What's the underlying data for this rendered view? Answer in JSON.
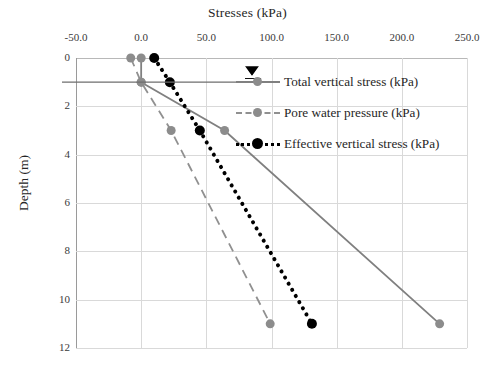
{
  "chart_data": {
    "type": "line",
    "title": "",
    "xlabel": "Stresses (kPa)",
    "ylabel": "Depth (m)",
    "xlim": [
      -50.0,
      250.0
    ],
    "ylim": [
      0,
      12
    ],
    "y_inverted": true,
    "grid": true,
    "legend_position": "inside-top-right",
    "xticks": [
      "-50.0",
      "0.0",
      "50.0",
      "100.0",
      "150.0",
      "200.0",
      "250.0"
    ],
    "xtick_values": [
      -50.0,
      0.0,
      50.0,
      100.0,
      150.0,
      200.0,
      250.0
    ],
    "yticks": [
      "0",
      "2",
      "4",
      "6",
      "8",
      "10",
      "12"
    ],
    "ytick_values": [
      0,
      2,
      4,
      6,
      8,
      10,
      12
    ],
    "series": [
      {
        "name": "Total vertical stress (kPa)",
        "color": "#808080",
        "style": "solid",
        "marker": "circle-gray",
        "x": [
          0,
          0,
          64,
          229
        ],
        "y": [
          0,
          1,
          3,
          11
        ]
      },
      {
        "name": "Pore water pressure (kPa)",
        "color": "#909090",
        "style": "dashed",
        "marker": "circle-gray",
        "x": [
          -8,
          0,
          23,
          99
        ],
        "y": [
          0,
          1,
          3,
          11
        ]
      },
      {
        "name": "Effective vertical stress (kPa)",
        "color": "#000000",
        "style": "dotted",
        "marker": "circle-black",
        "x": [
          10,
          22,
          45,
          131
        ],
        "y": [
          0,
          1,
          3,
          11
        ]
      }
    ],
    "annotations": [
      {
        "name": "water-table",
        "symbol": "triangle-down-with-lines",
        "depth": 1.0,
        "x_position": 85
      },
      {
        "name": "water-table-level-line",
        "symbol": "horizontal-line",
        "depth": 1.0
      }
    ]
  },
  "legend": {
    "items": [
      {
        "label": "Total vertical stress (kPa)"
      },
      {
        "label": "Pore water pressure (kPa)"
      },
      {
        "label": "Effective vertical stress (kPa)"
      }
    ]
  }
}
